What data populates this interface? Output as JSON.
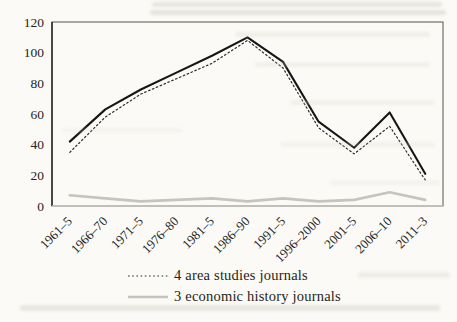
{
  "chart_data": {
    "type": "line",
    "categories": [
      "1961–5",
      "1966–70",
      "1971–5",
      "1976–80",
      "1981–5",
      "1986–90",
      "1991–5",
      "1996–2000",
      "2001–5",
      "2006–10",
      "2011–3"
    ],
    "series": [
      {
        "name": "(unlabeled solid line)",
        "style": "solid-black",
        "color": "#161616",
        "values": [
          42,
          63,
          76,
          87,
          98,
          110,
          94,
          55,
          38,
          61,
          21
        ]
      },
      {
        "name": "4 area studies journals",
        "style": "dotted-black",
        "color": "#2b2b2b",
        "values": [
          35,
          58,
          73,
          83,
          93,
          108,
          90,
          51,
          34,
          52,
          17
        ]
      },
      {
        "name": "3 economic history journals",
        "style": "solid-gray",
        "color": "#c5c5c0",
        "values": [
          7,
          5,
          3,
          4,
          5,
          3,
          5,
          3,
          4,
          9,
          4
        ]
      }
    ],
    "title": "",
    "xlabel": "",
    "ylabel": "",
    "ylim": [
      0,
      120
    ],
    "yticks": [
      "0",
      "20",
      "40",
      "60",
      "80",
      "100",
      "120"
    ],
    "grid": false,
    "legend_position": "bottom-center",
    "legend": [
      {
        "label": "4 area studies journals",
        "style": "dotted-black"
      },
      {
        "label": "3 economic history journals",
        "style": "solid-gray"
      }
    ]
  },
  "colors": {
    "paper": "#fbfaf6",
    "axis_dark": "#2f2f2b",
    "axis_border": "#55544f",
    "axis_bottom_light": "#c9c7c0",
    "text": "#25251f",
    "line_solid_black": "#161616",
    "line_dotted_black": "#2b2b2b",
    "line_light_gray": "#c5c5c0"
  }
}
